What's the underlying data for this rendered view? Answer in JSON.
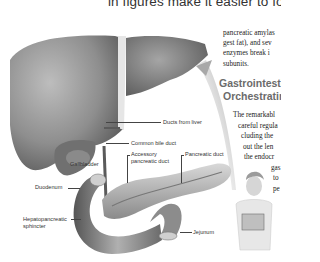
{
  "page": {
    "top_line": "in figures make it easier to follo",
    "paragraph_1": [
      "pancreatic amylas",
      "gest fat), and sev",
      "enzymes break i",
      "subunits."
    ],
    "section_heading": [
      "Gastrointestir",
      "Orchestratin"
    ],
    "paragraph_2": [
      "The remarkabl",
      "careful regula",
      "cluding the",
      "out the len",
      "the endocr",
      "gas",
      "to",
      "pe"
    ]
  },
  "figure": {
    "labels": {
      "ducts_from_liver": "Ducts from liver",
      "common_bile_duct": "Common bile duct",
      "gallbladder": "Gallbladder",
      "accessory_pancreatic_duct": [
        "Accessory",
        "pancreatic duct"
      ],
      "pancreatic_duct": "Pancreatic duct",
      "duodenum": "Duodenum",
      "hepatopancreatic_sphincter": [
        "Hepatopancreatic",
        "sphincter"
      ],
      "jejunum": "Jejunum"
    }
  }
}
